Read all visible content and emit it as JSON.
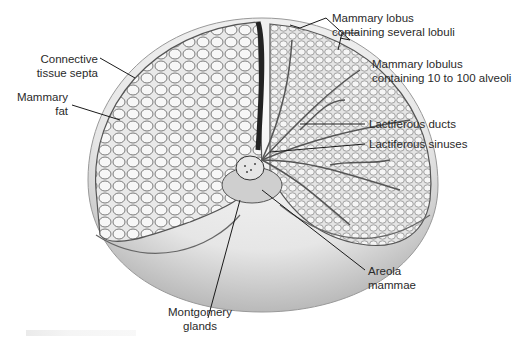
{
  "figure": {
    "labels": {
      "mammary_lobus": [
        "Mammary lobus",
        "containing several lobuli"
      ],
      "mammary_lobulus": [
        "Mammary lobulus",
        "containing 10 to 100 alveoli"
      ],
      "connective_tissue_septa": [
        "Connective",
        "tissue septa"
      ],
      "mammary_fat": [
        "Mammary",
        "fat"
      ],
      "lactiferous_ducts": "Lactiferous ducts",
      "lactiferous_sinuses": "Lactiferous sinuses",
      "areola_mammae": [
        "Areola",
        "mammae"
      ],
      "montgomery_glands": [
        "Montgomery",
        "glands"
      ]
    },
    "colors": {
      "background": "#ffffff",
      "tissue_light": "#f2f2f2",
      "tissue_mid": "#c8c8c8",
      "tissue_dark": "#3a3a3a",
      "leader_line": "#1a1a1a",
      "label_text": "#2a2a2a"
    }
  }
}
